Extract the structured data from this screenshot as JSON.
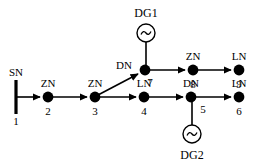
{
  "diagram": {
    "stroke_color": "#000000",
    "background_color": "#ffffff",
    "width": 255,
    "height": 166,
    "source": {
      "name": "SN",
      "label": "SN",
      "number": "1",
      "x": 16,
      "y": 97,
      "bar_top": 80,
      "bar_bottom": 114
    },
    "nodes": [
      {
        "id": "n2",
        "type_label": "ZN",
        "number": "2",
        "x": 48,
        "y": 97,
        "type_pos": "above",
        "num_pos": "below"
      },
      {
        "id": "n3",
        "type_label": "ZN",
        "number": "3",
        "x": 95,
        "y": 97,
        "type_pos": "above",
        "num_pos": "below"
      },
      {
        "id": "n4",
        "type_label": "LN",
        "number": "4",
        "x": 144,
        "y": 97,
        "type_pos": "above",
        "num_pos": "below"
      },
      {
        "id": "n5",
        "type_label": "DN",
        "number": "5",
        "x": 191,
        "y": 97,
        "type_pos": "above",
        "num_pos": "below-right"
      },
      {
        "id": "n6",
        "type_label": "LN",
        "number": "6",
        "x": 239,
        "y": 97,
        "type_pos": "above",
        "num_pos": "below"
      },
      {
        "id": "n7",
        "type_label": "DN",
        "number": "7",
        "x": 145,
        "y": 70,
        "type_pos": "left",
        "num_pos": "below-right"
      },
      {
        "id": "n8",
        "type_label": "ZN",
        "number": "8",
        "x": 193,
        "y": 70,
        "type_pos": "above",
        "num_pos": "below"
      },
      {
        "id": "n9",
        "type_label": "LN",
        "number": "9",
        "x": 239,
        "y": 70,
        "type_pos": "above",
        "num_pos": "below"
      }
    ],
    "edges": [
      {
        "id": "e1",
        "from": "SN",
        "to": "n2",
        "x1": 17,
        "y1": 97,
        "x2": 43,
        "y2": 97,
        "arrow": true
      },
      {
        "id": "e2",
        "from": "n2",
        "to": "n3",
        "x1": 53,
        "y1": 97,
        "x2": 90,
        "y2": 97,
        "arrow": true
      },
      {
        "id": "e3",
        "from": "n3",
        "to": "n4",
        "x1": 100,
        "y1": 97,
        "x2": 139,
        "y2": 97,
        "arrow": true
      },
      {
        "id": "e4",
        "from": "n4",
        "to": "n5",
        "x1": 149,
        "y1": 97,
        "x2": 186,
        "y2": 97,
        "arrow": true
      },
      {
        "id": "e5",
        "from": "n5",
        "to": "n6",
        "x1": 196,
        "y1": 97,
        "x2": 234,
        "y2": 97,
        "arrow": true
      },
      {
        "id": "e6",
        "from": "n3",
        "to": "n7",
        "x1": 99,
        "y1": 95,
        "x2": 141,
        "y2": 73,
        "arrow": true
      },
      {
        "id": "e7",
        "from": "n7",
        "to": "n8",
        "x1": 150,
        "y1": 70,
        "x2": 188,
        "y2": 70,
        "arrow": true
      },
      {
        "id": "e8",
        "from": "n8",
        "to": "n9",
        "x1": 198,
        "y1": 70,
        "x2": 234,
        "y2": 70,
        "arrow": true
      }
    ],
    "generators": [
      {
        "id": "dg1",
        "label": "DG1",
        "attached_to": "n7",
        "circle_x": 146,
        "circle_y": 33,
        "radius": 9,
        "label_x": 146,
        "label_y": 16,
        "stub_x1": 146,
        "stub_y1": 42,
        "stub_x2": 146,
        "stub_y2": 70
      },
      {
        "id": "dg2",
        "label": "DG2",
        "attached_to": "n5",
        "circle_x": 192,
        "circle_y": 134,
        "radius": 9,
        "label_x": 192,
        "label_y": 158,
        "stub_x1": 192,
        "stub_y1": 97,
        "stub_x2": 192,
        "stub_y2": 125
      }
    ],
    "legend_types": {
      "SN": "source node",
      "ZN": "zone node",
      "LN": "load node",
      "DN": "distributed generation node"
    }
  }
}
